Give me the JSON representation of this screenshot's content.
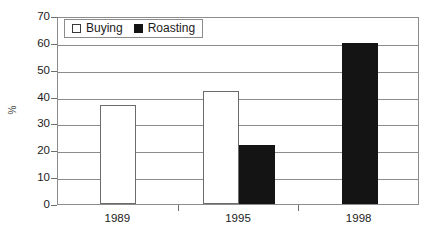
{
  "chart_data": {
    "type": "bar",
    "title": "",
    "subtitle": "",
    "xlabel": "",
    "ylabel": "%",
    "categories": [
      "1989",
      "1995",
      "1998"
    ],
    "series": [
      {
        "name": "Buying",
        "values": [
          37,
          42,
          null
        ],
        "color": "#ffffff",
        "swatch": "white-outlined-square"
      },
      {
        "name": "Roasting",
        "values": [
          null,
          22,
          60
        ],
        "color": "#141414",
        "swatch": "black-filled-square"
      }
    ],
    "ylim": [
      0,
      70
    ],
    "ytick_values": [
      0,
      10,
      20,
      30,
      40,
      50,
      60,
      70
    ],
    "ytick_labels": [
      "0",
      "10",
      "20",
      "30",
      "40",
      "50",
      "60",
      "70"
    ],
    "grid": "horizontal",
    "legend_position": "top-left-inside",
    "axis_color": "#8c8c8c",
    "text_color": "#1c1c1c"
  },
  "legend": {
    "entries": [
      {
        "label": "Buying"
      },
      {
        "label": "Roasting"
      }
    ]
  }
}
